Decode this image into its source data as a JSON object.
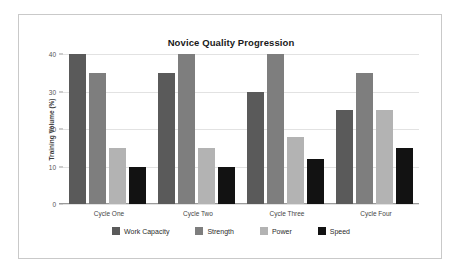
{
  "chart_data": {
    "type": "bar",
    "title": "Novice Quality Progression",
    "xlabel": "",
    "ylabel": "Training Volume (%)",
    "categories": [
      "Cycle One",
      "Cycle Two",
      "Cycle Three",
      "Cycle Four"
    ],
    "series": [
      {
        "name": "Work Capacity",
        "color": "#5a5a5a",
        "values": [
          40,
          35,
          30,
          25
        ]
      },
      {
        "name": "Strength",
        "color": "#7e7e7e",
        "values": [
          35,
          40,
          40,
          35
        ]
      },
      {
        "name": "Power",
        "color": "#b3b3b3",
        "values": [
          15,
          15,
          18,
          25
        ]
      },
      {
        "name": "Speed",
        "color": "#121212",
        "values": [
          10,
          10,
          12,
          15
        ]
      }
    ],
    "ylim": [
      0,
      40
    ],
    "yticks": [
      0,
      10,
      20,
      30,
      40
    ],
    "ytick_labels": [
      "0",
      "10",
      "20",
      "30",
      "40"
    ],
    "grid": true,
    "legend_position": "bottom"
  },
  "legend": {
    "items": [
      {
        "label": "Work Capacity",
        "color": "#5a5a5a"
      },
      {
        "label": "Strength",
        "color": "#7e7e7e"
      },
      {
        "label": "Power",
        "color": "#b3b3b3"
      },
      {
        "label": "Speed",
        "color": "#121212"
      }
    ]
  }
}
